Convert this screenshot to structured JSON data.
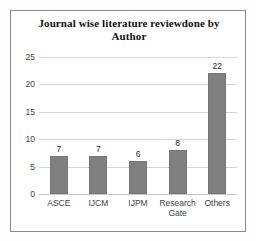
{
  "chart_data": {
    "type": "bar",
    "title": "Journal wise literature reviewdone by Author",
    "title_lines": [
      "Journal wise literature reviewdone by",
      "Author"
    ],
    "categories": [
      "ASCE",
      "IJCM",
      "IJPM",
      "Research Gate",
      "Others"
    ],
    "values": [
      7,
      7,
      6,
      8,
      22
    ],
    "value_labels": [
      "7",
      "7",
      "6",
      "8",
      "22"
    ],
    "xlabel": "",
    "ylabel": "",
    "ylim": [
      0,
      25
    ],
    "yticks": [
      0,
      5,
      10,
      15,
      20,
      25
    ],
    "ytick_labels": [
      "0",
      "5",
      "10",
      "15",
      "20",
      "25"
    ],
    "grid": true,
    "grid_axis": "y",
    "legend": false,
    "legend_position": "none",
    "bar_color": "#808080",
    "grid_color": "#d6d6d6",
    "text_color": "#3f3f3f",
    "title_color": "#111111",
    "border_color": "#8a8a8a",
    "background": "#ffffff"
  }
}
